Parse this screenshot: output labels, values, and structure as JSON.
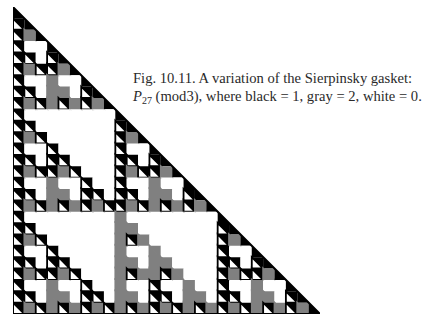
{
  "figure": {
    "caption": {
      "label": "Fig. 10.11.",
      "line1_text": "A variation of the Sierpinsky gasket:",
      "symbol": "P",
      "subscript": "27",
      "line2_text": "(mod3), where black = 1, gray = 2, white = 0."
    },
    "gasket": {
      "rows": 27,
      "modulus": 3,
      "size_px": 307,
      "colors": {
        "0": "#ffffff",
        "1": "#000000",
        "2": "#808080"
      },
      "legend": [
        {
          "color_name": "black",
          "value": 1
        },
        {
          "color_name": "gray",
          "value": 2
        },
        {
          "color_name": "white",
          "value": 0
        }
      ]
    }
  }
}
